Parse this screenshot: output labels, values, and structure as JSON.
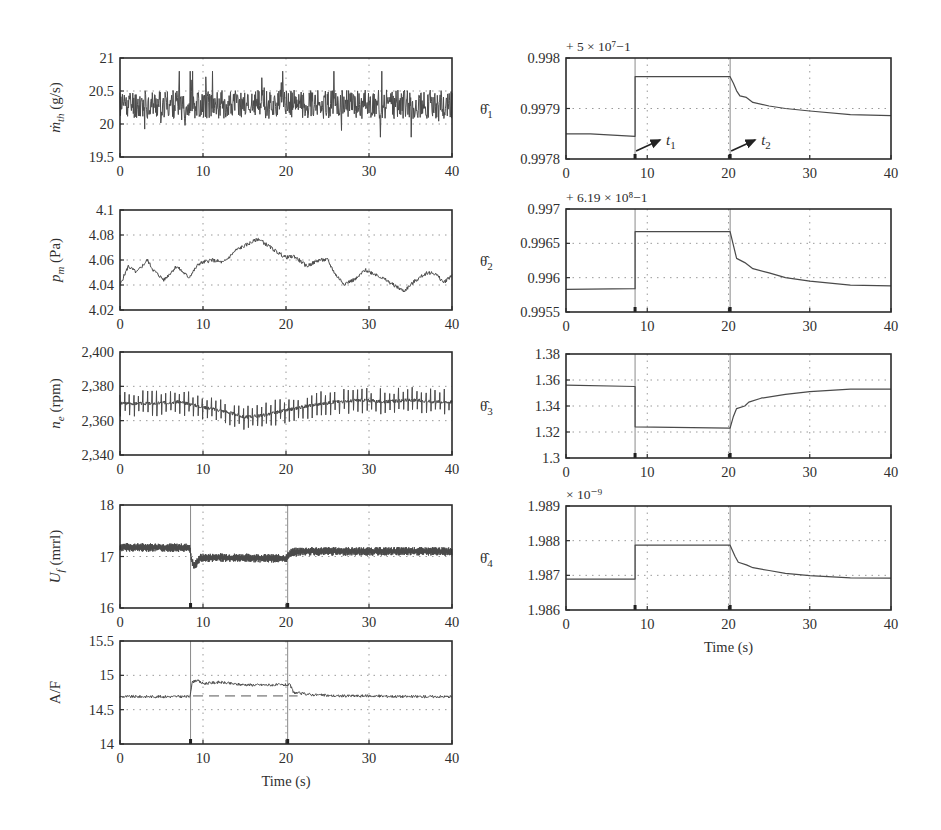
{
  "figure": {
    "x_axis_title": "Time (s)",
    "event_times": {
      "t1": 8.5,
      "t2": 20.2
    },
    "event_labels": {
      "t1": "t",
      "t1_sub": "1",
      "t2": "t",
      "t2_sub": "2"
    }
  },
  "chart_data": [
    {
      "id": "mth",
      "type": "line",
      "column": "left",
      "ylabel_main": "ṁ",
      "ylabel_sub": "th",
      "ylabel_unit": " (g/s)",
      "multiplier": "",
      "xlim": [
        0,
        40
      ],
      "ylim": [
        19.5,
        21
      ],
      "xticks": [
        "0",
        "10",
        "20",
        "30",
        "40"
      ],
      "yticks": [
        "19.5",
        "20",
        "20.5",
        "21"
      ],
      "ytick_values": [
        19.5,
        20,
        20.5,
        21
      ],
      "grid": true,
      "show_events": false,
      "series": [
        {
          "name": "throttle mass flow",
          "style": "noise",
          "x": [
            0,
            40
          ],
          "mean": 20.3,
          "amplitude": 0.22,
          "spike": 0.45,
          "seed": 11
        }
      ]
    },
    {
      "id": "pm",
      "type": "line",
      "column": "left",
      "ylabel_main": "p",
      "ylabel_sub": "m",
      "ylabel_unit": " (Pa)",
      "multiplier": "",
      "xlim": [
        0,
        40
      ],
      "ylim": [
        4.02,
        4.1
      ],
      "xticks": [
        "0",
        "10",
        "20",
        "30",
        "40"
      ],
      "yticks": [
        "4.02",
        "4.04",
        "4.06",
        "4.08",
        "4.1"
      ],
      "ytick_values": [
        4.02,
        4.04,
        4.06,
        4.08,
        4.1
      ],
      "grid": true,
      "show_events": false,
      "series": [
        {
          "name": "manifold pressure",
          "style": "wander",
          "x": [
            0,
            1,
            2,
            3.3,
            4,
            5.3,
            6.8,
            8.3,
            9.5,
            11,
            12.5,
            14,
            15.5,
            16.7,
            17.5,
            19,
            20,
            21,
            22.5,
            24,
            25,
            26,
            27,
            28.5,
            29.5,
            31,
            32.5,
            34.2,
            35.5,
            37,
            38,
            39,
            40
          ],
          "y": [
            4.04,
            4.055,
            4.05,
            4.06,
            4.052,
            4.044,
            4.055,
            4.046,
            4.057,
            4.06,
            4.058,
            4.068,
            4.073,
            4.077,
            4.073,
            4.066,
            4.062,
            4.063,
            4.055,
            4.06,
            4.06,
            4.048,
            4.041,
            4.045,
            4.052,
            4.048,
            4.042,
            4.035,
            4.043,
            4.05,
            4.049,
            4.042,
            4.048
          ],
          "jitter": 0.0015,
          "seed": 5
        }
      ]
    },
    {
      "id": "ne",
      "type": "line",
      "column": "left",
      "ylabel_main": "n",
      "ylabel_sub": "e",
      "ylabel_unit": " (rpm)",
      "multiplier": "",
      "xlim": [
        0,
        40
      ],
      "ylim": [
        2340,
        2400
      ],
      "xticks": [
        "0",
        "10",
        "20",
        "30",
        "40"
      ],
      "yticks": [
        "2,340",
        "2,360",
        "2,380",
        "2,400"
      ],
      "ytick_values": [
        2340,
        2360,
        2380,
        2400
      ],
      "grid": true,
      "show_events": false,
      "series": [
        {
          "name": "engine speed",
          "style": "oscillation",
          "x": [
            0,
            4,
            7,
            10,
            13,
            15,
            17,
            20,
            23,
            26,
            29,
            32,
            35,
            38,
            40
          ],
          "y": [
            2370,
            2370,
            2371,
            2368,
            2365,
            2362,
            2363,
            2366,
            2369,
            2371,
            2372,
            2371,
            2372,
            2371,
            2371
          ],
          "period": 0.55,
          "amplitude": 7,
          "seed": 3
        }
      ]
    },
    {
      "id": "uf",
      "type": "line",
      "column": "left",
      "ylabel_main": "U",
      "ylabel_sub": "f",
      "ylabel_unit": " (mrrl)",
      "multiplier": "",
      "xlim": [
        0,
        40
      ],
      "ylim": [
        16,
        18
      ],
      "xticks": [
        "0",
        "10",
        "20",
        "30",
        "40"
      ],
      "yticks": [
        "16",
        "17",
        "18"
      ],
      "ytick_values": [
        16,
        17,
        18
      ],
      "grid": true,
      "show_events": true,
      "series": [
        {
          "name": "fuel injection",
          "style": "band",
          "x": [
            0,
            8.4,
            8.6,
            8.9,
            9.6,
            12,
            20.0,
            20.6,
            22,
            40
          ],
          "y": [
            17.18,
            17.17,
            16.95,
            16.8,
            16.97,
            16.98,
            16.96,
            17.08,
            17.1,
            17.1
          ],
          "amplitude": 0.07,
          "seed": 7
        }
      ]
    },
    {
      "id": "af",
      "type": "line",
      "column": "left",
      "ylabel_main": "A/F",
      "ylabel_sub": "",
      "ylabel_unit": "",
      "multiplier": "",
      "xlim": [
        0,
        40
      ],
      "ylim": [
        14,
        15.5
      ],
      "xticks": [
        "0",
        "10",
        "20",
        "30",
        "40"
      ],
      "yticks": [
        "14",
        "14.5",
        "15",
        "15.5"
      ],
      "ytick_values": [
        14,
        14.5,
        15,
        15.5
      ],
      "grid": true,
      "show_events": true,
      "show_xtitle": true,
      "reference": 14.7,
      "series": [
        {
          "name": "air-fuel ratio",
          "style": "wander",
          "x": [
            0,
            8.4,
            8.7,
            9.2,
            10,
            12,
            14,
            16,
            18,
            20.5,
            20.9,
            21.5,
            23,
            26,
            30,
            35,
            40
          ],
          "y": [
            14.69,
            14.69,
            14.9,
            14.93,
            14.88,
            14.9,
            14.87,
            14.86,
            14.86,
            14.86,
            14.75,
            14.74,
            14.72,
            14.7,
            14.7,
            14.69,
            14.69
          ],
          "jitter": 0.02,
          "seed": 9
        }
      ]
    },
    {
      "id": "theta1",
      "type": "line",
      "column": "right",
      "ylabel_main": "θ̂",
      "ylabel_sub": "1",
      "ylabel_unit": "",
      "multiplier": "+ 5 × 10⁷−1",
      "xlim": [
        0,
        40
      ],
      "ylim": [
        0.9978,
        0.998
      ],
      "xticks": [
        "0",
        "10",
        "20",
        "30",
        "40"
      ],
      "yticks": [
        "0.9978",
        "0.9979",
        "0.998"
      ],
      "ytick_values": [
        0.9978,
        0.9979,
        0.998
      ],
      "grid": true,
      "show_events": true,
      "annotate_events": true,
      "series": [
        {
          "name": "theta1 estimate",
          "style": "step",
          "x": [
            0,
            3,
            8.5,
            8.5,
            20.2,
            20.6,
            21.0,
            21.4,
            22.2,
            23,
            25,
            27,
            30,
            35,
            40
          ],
          "y": [
            0.99785,
            0.99785,
            0.997845,
            0.997963,
            0.997963,
            0.99795,
            0.997935,
            0.997925,
            0.997922,
            0.997912,
            0.997905,
            0.9979,
            0.997895,
            0.997888,
            0.997886
          ]
        }
      ]
    },
    {
      "id": "theta2",
      "type": "line",
      "column": "right",
      "ylabel_main": "θ̂",
      "ylabel_sub": "2",
      "ylabel_unit": "",
      "multiplier": "+ 6.19 × 10⁸−1",
      "xlim": [
        0,
        40
      ],
      "ylim": [
        0.9955,
        0.997
      ],
      "xticks": [
        "0",
        "10",
        "20",
        "30",
        "40"
      ],
      "yticks": [
        "0.9955",
        "0.996",
        "0.9965",
        "0.997"
      ],
      "ytick_values": [
        0.9955,
        0.996,
        0.9965,
        0.997
      ],
      "grid": true,
      "show_events": true,
      "series": [
        {
          "name": "theta2 estimate",
          "style": "step",
          "x": [
            0,
            8.5,
            8.5,
            20.2,
            21.0,
            22.0,
            23.0,
            25,
            27,
            30,
            35,
            40
          ],
          "y": [
            0.99583,
            0.99584,
            0.99667,
            0.99667,
            0.99628,
            0.99622,
            0.99613,
            0.99607,
            0.996,
            0.99595,
            0.99589,
            0.99588
          ]
        }
      ]
    },
    {
      "id": "theta3",
      "type": "line",
      "column": "right",
      "ylabel_main": "θ̂",
      "ylabel_sub": "3",
      "ylabel_unit": "",
      "multiplier": "",
      "xlim": [
        0,
        40
      ],
      "ylim": [
        1.3,
        1.38
      ],
      "xticks": [
        "0",
        "10",
        "20",
        "30",
        "40"
      ],
      "yticks": [
        "1.3",
        "1.32",
        "1.34",
        "1.36",
        "1.38"
      ],
      "ytick_values": [
        1.3,
        1.32,
        1.34,
        1.36,
        1.38
      ],
      "grid": true,
      "show_events": true,
      "series": [
        {
          "name": "theta3 estimate",
          "style": "step",
          "x": [
            0,
            8.5,
            8.5,
            20.2,
            20.6,
            21.0,
            22.0,
            22.5,
            24,
            27,
            30,
            35,
            40
          ],
          "y": [
            1.356,
            1.355,
            1.324,
            1.323,
            1.332,
            1.338,
            1.34,
            1.343,
            1.346,
            1.349,
            1.351,
            1.353,
            1.353
          ]
        }
      ]
    },
    {
      "id": "theta4",
      "type": "line",
      "column": "right",
      "ylabel_main": "θ̂",
      "ylabel_sub": "4",
      "ylabel_unit": "",
      "multiplier": "× 10⁻⁹",
      "xlim": [
        0,
        40
      ],
      "ylim": [
        1.986,
        1.989
      ],
      "xticks": [
        "0",
        "10",
        "20",
        "30",
        "40"
      ],
      "yticks": [
        "1.986",
        "1.987",
        "1.988",
        "1.989"
      ],
      "ytick_values": [
        1.986,
        1.987,
        1.988,
        1.989
      ],
      "grid": true,
      "show_events": true,
      "show_xtitle": true,
      "series": [
        {
          "name": "theta4 estimate",
          "style": "step",
          "x": [
            0,
            8.5,
            8.5,
            20.2,
            20.8,
            21.2,
            22.2,
            23,
            25,
            27,
            30,
            35,
            40
          ],
          "y": [
            1.98689,
            1.98689,
            1.98787,
            1.98787,
            1.98755,
            1.98738,
            1.9873,
            1.98722,
            1.98714,
            1.98706,
            1.98699,
            1.98693,
            1.98692
          ]
        }
      ]
    }
  ]
}
